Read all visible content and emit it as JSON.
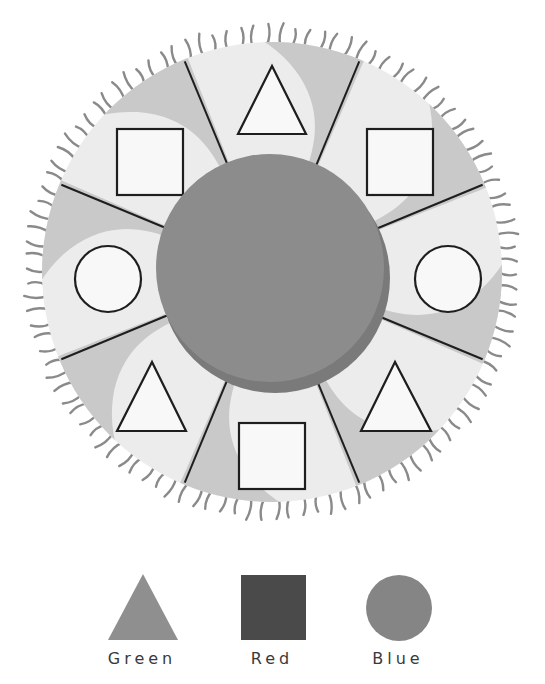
{
  "diagram": {
    "colors": {
      "background": "#ffffff",
      "wheel_light": "#ececec",
      "wheel_band": "#c9c9c9",
      "fringe": "#8a8a8a",
      "divider": "#1e1e1e",
      "shape_fill": "#f8f8f8",
      "shape_stroke": "#1e1e1e",
      "center_disc": "#8c8c8c",
      "center_disc_rim": "#7a7a7a"
    },
    "wheel": {
      "center": [
        272,
        272
      ],
      "outer_radius": 230,
      "center_disc_radius": 115,
      "sector_count": 8,
      "sectors": [
        {
          "position": "top",
          "shape": "triangle"
        },
        {
          "position": "top-right",
          "shape": "square"
        },
        {
          "position": "right",
          "shape": "circle"
        },
        {
          "position": "bottom-right",
          "shape": "triangle"
        },
        {
          "position": "bottom",
          "shape": "square"
        },
        {
          "position": "bottom-left",
          "shape": "triangle"
        },
        {
          "position": "left",
          "shape": "circle"
        },
        {
          "position": "top-left",
          "shape": "square"
        }
      ]
    },
    "legend": [
      {
        "shape": "triangle",
        "label": "Green",
        "color": "#8f8f8f"
      },
      {
        "shape": "square",
        "label": "Red",
        "color": "#4a4a4a"
      },
      {
        "shape": "circle",
        "label": "Blue",
        "color": "#858585"
      }
    ]
  }
}
